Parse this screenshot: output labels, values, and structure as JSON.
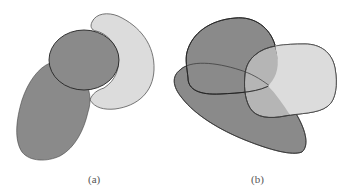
{
  "panels": [
    {
      "id": "a",
      "caption": "(a)",
      "description": "Elongated dark blob with a dark circle on top, and a light crescent wrapping the circle's right side",
      "shapes": [
        {
          "name": "dark-elongated-blob",
          "fill": "#8a8a8a"
        },
        {
          "name": "dark-circle",
          "fill": "#8a8a8a"
        },
        {
          "name": "light-crescent",
          "fill": "#dcdcdc"
        }
      ]
    },
    {
      "id": "b",
      "caption": "(b)",
      "description": "Two overlapping dark blobs and one light rounded-square blob partially overlapping both",
      "shapes": [
        {
          "name": "dark-top-blob",
          "fill": "#8a8a8a"
        },
        {
          "name": "dark-bottom-elongated-blob",
          "fill": "#8a8a8a"
        },
        {
          "name": "light-right-blob",
          "fill": "#dcdcdc"
        }
      ]
    }
  ],
  "colors": {
    "dark": "#8a8a8a",
    "light": "#dcdcdc",
    "overlap": "#a8a8a8",
    "stroke": "#333333"
  }
}
